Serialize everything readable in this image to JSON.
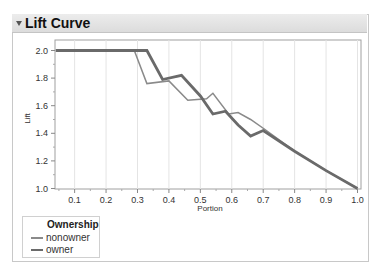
{
  "panel": {
    "title": "Lift Curve",
    "disclosure_icon": "triangle-down-icon"
  },
  "legend": {
    "title": "Ownership",
    "items": [
      {
        "label": "nonowner",
        "color": "#8a8a8a"
      },
      {
        "label": "owner",
        "color": "#6a6a6a"
      }
    ]
  },
  "chart_data": {
    "type": "line",
    "title": "Lift Curve",
    "xlabel": "Portion",
    "ylabel": "Lift",
    "xlim": [
      0.04,
      1.0
    ],
    "ylim": [
      1.0,
      2.08
    ],
    "x_ticks": [
      "0.1",
      "0.2",
      "0.3",
      "0.4",
      "0.5",
      "0.6",
      "0.7",
      "0.8",
      "0.9",
      "1.0"
    ],
    "y_ticks": [
      "1.0",
      "1.2",
      "1.4",
      "1.6",
      "1.8",
      "2.0"
    ],
    "grid": true,
    "legend_position": "bottom-left",
    "series": [
      {
        "name": "nonowner",
        "style": "thin",
        "points": [
          [
            0.04,
            2.0
          ],
          [
            0.29,
            2.0
          ],
          [
            0.33,
            1.76
          ],
          [
            0.4,
            1.78
          ],
          [
            0.46,
            1.64
          ],
          [
            0.52,
            1.65
          ],
          [
            0.54,
            1.69
          ],
          [
            0.59,
            1.54
          ],
          [
            0.62,
            1.55
          ],
          [
            0.66,
            1.5
          ],
          [
            0.71,
            1.42
          ],
          [
            0.8,
            1.27
          ],
          [
            0.9,
            1.13
          ],
          [
            1.0,
            1.0
          ]
        ]
      },
      {
        "name": "owner",
        "style": "thick",
        "points": [
          [
            0.04,
            2.0
          ],
          [
            0.33,
            2.0
          ],
          [
            0.38,
            1.79
          ],
          [
            0.44,
            1.82
          ],
          [
            0.5,
            1.67
          ],
          [
            0.54,
            1.54
          ],
          [
            0.58,
            1.56
          ],
          [
            0.62,
            1.46
          ],
          [
            0.66,
            1.38
          ],
          [
            0.7,
            1.42
          ],
          [
            0.8,
            1.27
          ],
          [
            0.9,
            1.13
          ],
          [
            1.0,
            1.0
          ]
        ]
      }
    ]
  }
}
